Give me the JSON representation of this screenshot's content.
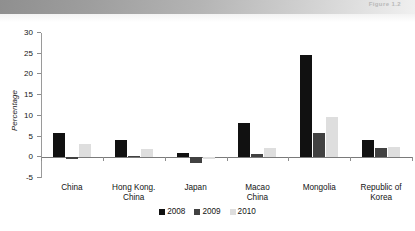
{
  "page": {
    "band_title": "Figure 1.2"
  },
  "chart_data": {
    "type": "bar",
    "title": "",
    "xlabel": "",
    "ylabel": "Percentage",
    "ylim": [
      -5,
      30
    ],
    "yticks": [
      30,
      25,
      20,
      15,
      10,
      5,
      0,
      -5
    ],
    "grid": false,
    "legend_position": "bottom",
    "categories": [
      "China",
      "Hong Kong. China",
      "Japan",
      "Macao China",
      "Mongolia",
      "Republic of Korea"
    ],
    "category_lines": [
      [
        "China"
      ],
      [
        "Hong Kong.",
        "China"
      ],
      [
        "Japan"
      ],
      [
        "Macao",
        "China"
      ],
      [
        "Mongolia"
      ],
      [
        "Republic of",
        "Korea"
      ]
    ],
    "series": [
      {
        "name": "2008",
        "color": "#111111",
        "values": [
          5.8,
          4.1,
          1.1,
          8.2,
          24.7,
          4.1
        ]
      },
      {
        "name": "2009",
        "color": "#414141",
        "values": [
          -0.4,
          0.3,
          -1.5,
          0.9,
          5.8,
          2.3
        ]
      },
      {
        "name": "2010",
        "color": "#dedede",
        "values": [
          3.1,
          2.0,
          -0.4,
          2.3,
          9.7,
          2.4
        ]
      }
    ]
  }
}
